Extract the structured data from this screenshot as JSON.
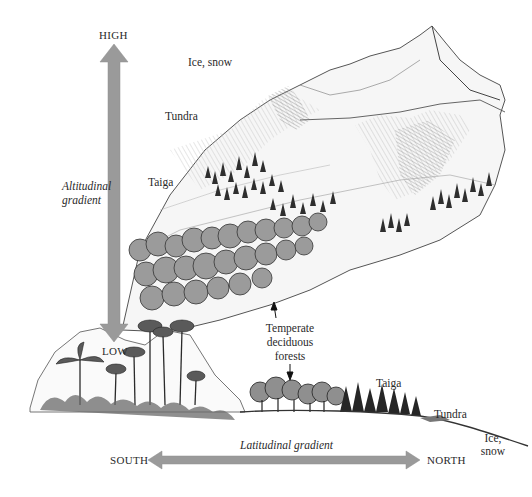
{
  "diagram": {
    "altitude_axis": {
      "top_label": "HIGH",
      "bottom_label": "LOW",
      "title_line1": "Altitudinal",
      "title_line2": "gradient"
    },
    "latitude_axis": {
      "left_label": "SOUTH",
      "right_label": "NORTH",
      "title": "Latitudinal gradient"
    },
    "mountain_zones": {
      "ice_snow": "Ice, snow",
      "tundra": "Tundra",
      "taiga": "Taiga"
    },
    "shared_zone": {
      "line1": "Temperate",
      "line2": "deciduous",
      "line3": "forests"
    },
    "lowland_zones": {
      "taiga": "Taiga",
      "tundra": "Tundra",
      "ice_line1": "Ice,",
      "ice_line2": "snow"
    },
    "colors": {
      "arrow_fill": "#9a9a9a",
      "ink": "#2a2a2a",
      "background": "#ffffff"
    }
  }
}
